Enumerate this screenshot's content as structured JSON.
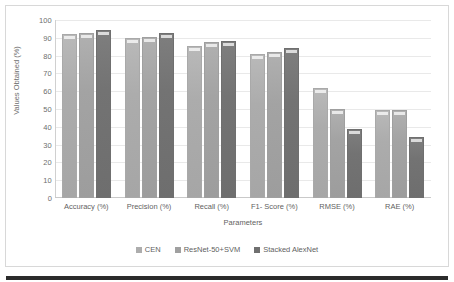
{
  "chart_data": {
    "type": "bar",
    "title": "",
    "xlabel": "Parameters",
    "ylabel": "Values Obtained (%)",
    "ylim": [
      0,
      100
    ],
    "ytick_step": 10,
    "yticks": [
      "100",
      "90",
      "80",
      "70",
      "60",
      "50",
      "40",
      "30",
      "20",
      "10",
      "0"
    ],
    "grid": true,
    "legend_position": "bottom",
    "categories": [
      "Accuracy (%)",
      "Precision (%)",
      "Recall (%)",
      "F1- Score (%)",
      "RMSE (%)",
      "RAE (%)"
    ],
    "series": [
      {
        "name": "CEN",
        "color": "#adadad",
        "values": [
          92,
          90,
          85.5,
          81,
          62,
          49.5
        ]
      },
      {
        "name": "ResNet-50+SVM",
        "color": "#a0a0a0",
        "values": [
          92.5,
          90.5,
          87.5,
          82,
          50,
          49.5
        ]
      },
      {
        "name": "Stacked AlexNet",
        "color": "#707070",
        "values": [
          94.5,
          92.5,
          88,
          84.5,
          39,
          34
        ]
      }
    ]
  }
}
